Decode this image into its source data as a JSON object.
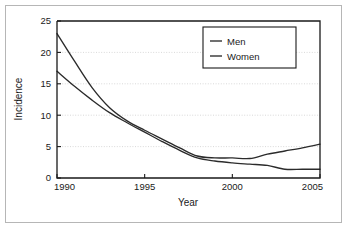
{
  "chart_data": {
    "type": "line",
    "title": "",
    "xlabel": "Year",
    "ylabel": "Incidence",
    "xlim": [
      1990,
      2005
    ],
    "ylim": [
      0,
      25
    ],
    "xticks": [
      1990,
      1995,
      2000,
      2005
    ],
    "yticks": [
      0,
      5,
      10,
      15,
      20,
      25
    ],
    "xtick_labels": [
      "1990",
      "1995",
      "2000",
      "2005"
    ],
    "ytick_labels": [
      "0",
      "5",
      "10",
      "15",
      "20",
      "25"
    ],
    "grid": "horizontal-dotted",
    "legend_position": "top-right-inside",
    "series": [
      {
        "name": "Men",
        "color": "#2b2b2b",
        "x": [
          1990,
          1991,
          1992,
          1993,
          1994,
          1995,
          1996,
          1997,
          1998,
          1999,
          2000,
          2001,
          2002,
          2003,
          2004,
          2005
        ],
        "values": [
          23.0,
          18.6,
          14.4,
          11.2,
          9.1,
          7.6,
          6.2,
          4.8,
          3.5,
          3.2,
          3.2,
          3.1,
          3.8,
          4.3,
          4.8,
          5.4
        ]
      },
      {
        "name": "Women",
        "color": "#2b2b2b",
        "x": [
          1990,
          1991,
          1992,
          1993,
          1994,
          1995,
          1996,
          1997,
          1998,
          1999,
          2000,
          2001,
          2002,
          2003,
          2004,
          2005
        ],
        "values": [
          17.0,
          14.6,
          12.4,
          10.4,
          8.8,
          7.3,
          5.8,
          4.4,
          3.2,
          2.7,
          2.4,
          2.2,
          2.0,
          1.4,
          1.4,
          1.4
        ]
      }
    ]
  },
  "legend": {
    "items": [
      {
        "label": "Men"
      },
      {
        "label": "Women"
      }
    ]
  },
  "axes": {
    "x_title": "Year",
    "y_title": "Incidence"
  }
}
